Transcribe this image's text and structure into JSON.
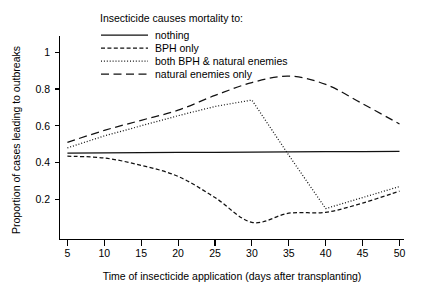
{
  "chart_data": {
    "type": "line",
    "title": "",
    "xlabel": "Time of insecticide application (days after transplanting)",
    "ylabel": "Proportion of cases leading to outbreaks",
    "xlim": [
      5,
      50
    ],
    "ylim": [
      0,
      1.15
    ],
    "grid": false,
    "legend_position": "top-center",
    "legend_title": "Insecticide causes mortality to:",
    "xticks": [
      5,
      10,
      15,
      20,
      25,
      30,
      35,
      40,
      45,
      50
    ],
    "xtick_labels": [
      "5",
      "10",
      "15",
      "20",
      "25",
      "30",
      "35",
      "40",
      "45",
      "50"
    ],
    "yticks": [
      0.2,
      0.4,
      0.6,
      0.8,
      1
    ],
    "ytick_labels": [
      "0.2",
      "0.4",
      "0.6",
      "0.8",
      "1"
    ],
    "x": [
      5,
      10,
      15,
      20,
      25,
      30,
      35,
      40,
      45,
      50
    ],
    "series": [
      {
        "name": "nothing",
        "style": "solid",
        "values": [
          0.452,
          0.453,
          0.454,
          0.455,
          0.456,
          0.457,
          0.458,
          0.459,
          0.46,
          0.461
        ]
      },
      {
        "name": "BPH only",
        "style": "dashed",
        "values": [
          0.435,
          0.425,
          0.385,
          0.325,
          0.21,
          0.075,
          0.125,
          0.13,
          0.18,
          0.245
        ]
      },
      {
        "name": "both BPH & natural enemies",
        "style": "dotted",
        "values": [
          0.48,
          0.545,
          0.6,
          0.655,
          0.705,
          0.74,
          0.44,
          0.15,
          0.21,
          0.27
        ]
      },
      {
        "name": "natural enemies only",
        "style": "longdash",
        "values": [
          0.51,
          0.575,
          0.63,
          0.685,
          0.765,
          0.835,
          0.87,
          0.825,
          0.72,
          0.61
        ]
      }
    ]
  },
  "legend": {
    "title": "Insecticide causes mortality to:",
    "entries": [
      {
        "label": "nothing",
        "style": "solid"
      },
      {
        "label": "BPH only",
        "style": "dashed"
      },
      {
        "label": "both BPH & natural enemies",
        "style": "dotted"
      },
      {
        "label": "natural enemies only",
        "style": "longdash"
      }
    ]
  },
  "axes": {
    "x_title": "Time of insecticide application (days after transplanting)",
    "y_title": "Proportion of cases leading to outbreaks",
    "x_labels": [
      "5",
      "10",
      "15",
      "20",
      "25",
      "30",
      "35",
      "40",
      "45",
      "50"
    ],
    "y_labels": [
      "0.2",
      "0.4",
      "0.6",
      "0.8",
      "1"
    ]
  },
  "colors": {
    "line": "#111111",
    "axis": "#000000",
    "background": "#ffffff"
  }
}
